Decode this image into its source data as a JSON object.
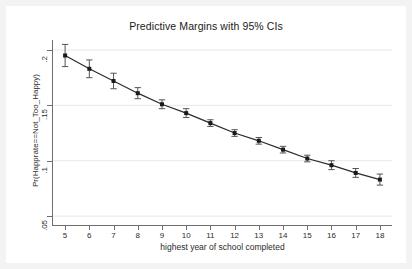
{
  "chart_data": {
    "type": "line",
    "title": "Predictive Margins with 95% CIs",
    "xlabel": "highest year of school completed",
    "ylabel": "Pr(Happrate==Not_Too_Happy)",
    "grid": true,
    "grid_axis": "y",
    "legend": "none",
    "xlim": [
      4.5,
      18.5
    ],
    "ylim": [
      0.042,
      0.209
    ],
    "xticks": [
      5,
      6,
      7,
      8,
      9,
      10,
      11,
      12,
      13,
      14,
      15,
      16,
      17,
      18
    ],
    "xticklabels": [
      "5",
      "6",
      "7",
      "8",
      "9",
      "10",
      "11",
      "12",
      "13",
      "14",
      "15",
      "16",
      "17",
      "18"
    ],
    "yticks": [
      0.05,
      0.1,
      0.15,
      0.2
    ],
    "yticklabels": [
      ".05",
      ".1",
      ".15",
      ".2"
    ],
    "marker": "filled-square",
    "errorbar": "95% CI",
    "series": [
      {
        "name": "Predictive margin",
        "x": [
          5,
          6,
          7,
          8,
          9,
          10,
          11,
          12,
          13,
          14,
          15,
          16,
          17,
          18
        ],
        "values": [
          0.195,
          0.183,
          0.172,
          0.161,
          0.151,
          0.143,
          0.134,
          0.125,
          0.118,
          0.11,
          0.102,
          0.096,
          0.089,
          0.083
        ],
        "ci_low": [
          0.185,
          0.175,
          0.165,
          0.156,
          0.147,
          0.139,
          0.131,
          0.122,
          0.115,
          0.107,
          0.099,
          0.092,
          0.085,
          0.078
        ],
        "ci_high": [
          0.205,
          0.191,
          0.179,
          0.166,
          0.155,
          0.147,
          0.137,
          0.128,
          0.121,
          0.113,
          0.105,
          0.1,
          0.093,
          0.088
        ]
      }
    ],
    "colors": {
      "line": "#2b2b2b",
      "marker": "#1a1a1a",
      "errorbar": "#555555",
      "grid": "#e8e8e8",
      "axis": "#6f6f6f",
      "plot_background": "#ffffff",
      "figure_background": "#f3f3f3"
    }
  }
}
